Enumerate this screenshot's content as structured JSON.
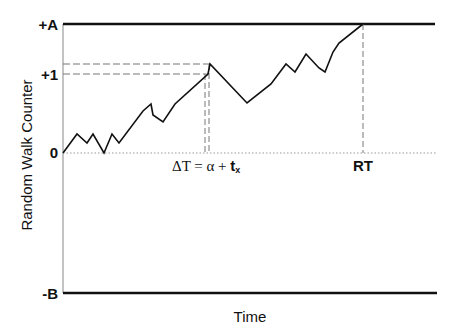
{
  "diagram": {
    "type": "random-walk-diffusion",
    "y_axis_label": "Random Walk Counter",
    "x_axis_label": "Time",
    "levels": {
      "upper_bound": "+A",
      "plus_one": "+1",
      "zero": "0",
      "lower_bound": "-B"
    },
    "annotations": {
      "delta_t": "ΔT = α + ",
      "delta_t_bold": "t",
      "delta_t_sub": "x",
      "rt": "RT"
    },
    "walk_points": [
      [
        63,
        153
      ],
      [
        77,
        134
      ],
      [
        87,
        143
      ],
      [
        93,
        134
      ],
      [
        104,
        153
      ],
      [
        112,
        134
      ],
      [
        119,
        143
      ],
      [
        143,
        111
      ],
      [
        151,
        104
      ],
      [
        153,
        115
      ],
      [
        163,
        122
      ],
      [
        175,
        104
      ],
      [
        208,
        74
      ],
      [
        210,
        64
      ],
      [
        247,
        103
      ],
      [
        271,
        84
      ],
      [
        286,
        64
      ],
      [
        295,
        72
      ],
      [
        306,
        54
      ],
      [
        319,
        68
      ],
      [
        325,
        72
      ],
      [
        333,
        52
      ],
      [
        339,
        43
      ],
      [
        363,
        24
      ]
    ],
    "colors": {
      "line": "#111111",
      "dashed": "#777777",
      "dotted": "#999999"
    }
  }
}
